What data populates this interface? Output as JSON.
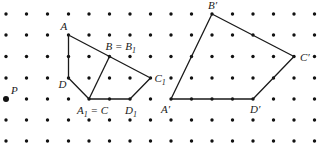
{
  "grid": {
    "columns": [
      6,
      26.5,
      47.5,
      68.5,
      89,
      109.5,
      130,
      150.5,
      171,
      191.5,
      212,
      232.5,
      253,
      273.5,
      294,
      314.5
    ],
    "rows": [
      14,
      35,
      56.5,
      78,
      99,
      120,
      141
    ],
    "dot_radius": 1.7,
    "dot_color": "#111111"
  },
  "line_color": "#1a1a1a",
  "points": {
    "A": {
      "col": 3,
      "row": 1,
      "label": "A",
      "lx": -8,
      "ly": -5
    },
    "B": {
      "col": 5,
      "row": 2,
      "label": "B = B",
      "sub": "1",
      "lx": -4,
      "ly": -7
    },
    "C1": {
      "col": 7,
      "row": 3,
      "label": "C",
      "sub": "1",
      "lx": 4,
      "ly": 4
    },
    "D": {
      "col": 3,
      "row": 3,
      "label": "D",
      "lx": -10,
      "ly": 10
    },
    "A1": {
      "col": 4,
      "row": 4,
      "label": "A",
      "sub": "1",
      "after": " = C",
      "lx": -12,
      "ly": 15
    },
    "D1": {
      "col": 6,
      "row": 4,
      "label": "D",
      "sub": "1",
      "lx": -5,
      "ly": 15
    },
    "P": {
      "col": 0,
      "row": 4,
      "label": "P",
      "lx": 5,
      "ly": -5
    },
    "Ap": {
      "col": 8,
      "row": 4,
      "label": "A′",
      "lx": -10,
      "ly": 14
    },
    "Bp": {
      "col": 10,
      "row": 0,
      "label": "B′",
      "lx": -4,
      "ly": -5
    },
    "Cp": {
      "col": 14,
      "row": 2,
      "label": "C′",
      "lx": 6,
      "ly": 4
    },
    "Dp": {
      "col": 12,
      "row": 4,
      "label": "D′",
      "lx": -3,
      "ly": 14
    }
  },
  "polygons": [
    {
      "name": "original-figure",
      "vertices": [
        "A",
        "C1",
        "D1",
        "A1",
        "D"
      ]
    },
    {
      "name": "image-figure",
      "vertices": [
        "Ap",
        "Bp",
        "Cp",
        "Dp"
      ]
    }
  ],
  "segments": [
    {
      "name": "segment-b-a1",
      "from": "B",
      "to": "A1"
    }
  ],
  "center_point": "P"
}
